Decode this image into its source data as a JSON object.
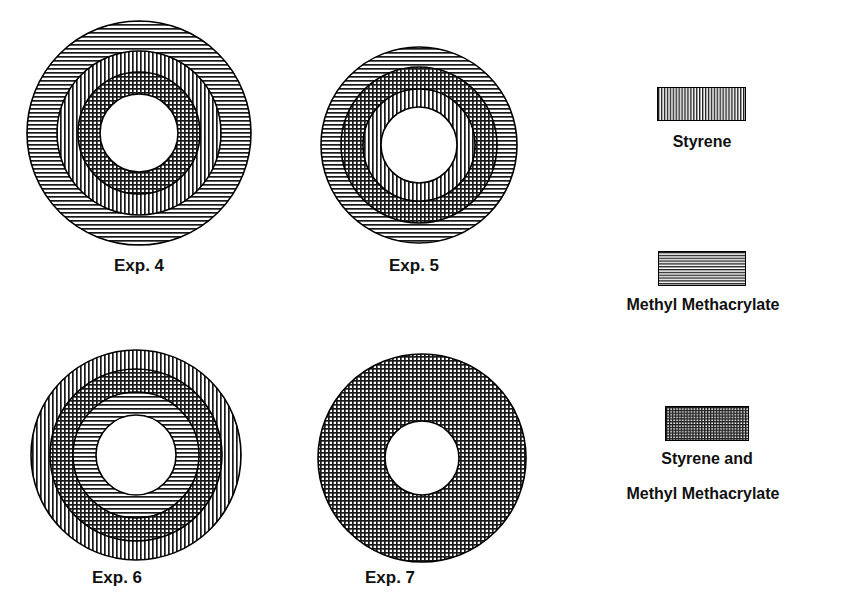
{
  "figure": {
    "title": "",
    "background_color": "#ffffff",
    "ink_color": "#000000",
    "width": 846,
    "height": 609
  },
  "chart_data": {
    "type": "diagram",
    "subtype": "concentric-ring-cross-sections",
    "title": "",
    "legend_position": "right",
    "patterns": {
      "vertical": "Styrene",
      "horizontal": "Methyl Methacrylate",
      "crosshatch": "Styrene and Methyl Methacrylate",
      "blank": "void / core"
    },
    "items": [
      {
        "id": "exp-4",
        "label": "Exp. 4",
        "cx": 139,
        "cy": 133,
        "outer_radius": 112,
        "rings": [
          {
            "pattern": "horizontal",
            "material": "Methyl Methacrylate",
            "outer_radius": 112,
            "inner_radius": 82
          },
          {
            "pattern": "vertical",
            "material": "Styrene",
            "outer_radius": 82,
            "inner_radius": 61
          },
          {
            "pattern": "crosshatch",
            "material": "Styrene and Methyl Methacrylate",
            "outer_radius": 61,
            "inner_radius": 39
          },
          {
            "pattern": "blank",
            "material": "void",
            "outer_radius": 39,
            "inner_radius": 0
          }
        ]
      },
      {
        "id": "exp-5",
        "label": "Exp. 5",
        "cx": 419,
        "cy": 145,
        "outer_radius": 98,
        "rings": [
          {
            "pattern": "horizontal",
            "material": "Methyl Methacrylate",
            "outer_radius": 98,
            "inner_radius": 78
          },
          {
            "pattern": "crosshatch",
            "material": "Styrene and Methyl Methacrylate",
            "outer_radius": 78,
            "inner_radius": 56
          },
          {
            "pattern": "vertical",
            "material": "Styrene",
            "outer_radius": 56,
            "inner_radius": 38
          },
          {
            "pattern": "blank",
            "material": "void",
            "outer_radius": 38,
            "inner_radius": 0
          }
        ]
      },
      {
        "id": "exp-6",
        "label": "Exp. 6",
        "cx": 136,
        "cy": 455,
        "outer_radius": 105,
        "rings": [
          {
            "pattern": "vertical",
            "material": "Styrene",
            "outer_radius": 105,
            "inner_radius": 86
          },
          {
            "pattern": "crosshatch",
            "material": "Styrene and Methyl Methacrylate",
            "outer_radius": 86,
            "inner_radius": 63
          },
          {
            "pattern": "horizontal",
            "material": "Methyl Methacrylate",
            "outer_radius": 63,
            "inner_radius": 40
          },
          {
            "pattern": "blank",
            "material": "void",
            "outer_radius": 40,
            "inner_radius": 0
          }
        ]
      },
      {
        "id": "exp-7",
        "label": "Exp. 7",
        "cx": 422,
        "cy": 458,
        "outer_radius": 104,
        "rings": [
          {
            "pattern": "crosshatch",
            "material": "Styrene and Methyl Methacrylate",
            "outer_radius": 104,
            "inner_radius": 37
          },
          {
            "pattern": "blank",
            "material": "void",
            "outer_radius": 37,
            "inner_radius": 0
          }
        ]
      }
    ]
  },
  "captions": {
    "exp4": "Exp. 4",
    "exp5": "Exp. 5",
    "exp6": "Exp. 6",
    "exp7": "Exp. 7"
  },
  "legend": {
    "entries": [
      {
        "pattern": "vertical",
        "line1": "Styrene",
        "line2": ""
      },
      {
        "pattern": "horizontal",
        "line1": "Methyl Methacrylate",
        "line2": ""
      },
      {
        "pattern": "crosshatch",
        "line1": "Styrene and",
        "line2": "Methyl Methacrylate"
      }
    ],
    "styrene_label": "Styrene",
    "mma_label": "Methyl Methacrylate",
    "both_label_line1": "Styrene and",
    "both_label_line2": "Methyl Methacrylate"
  }
}
